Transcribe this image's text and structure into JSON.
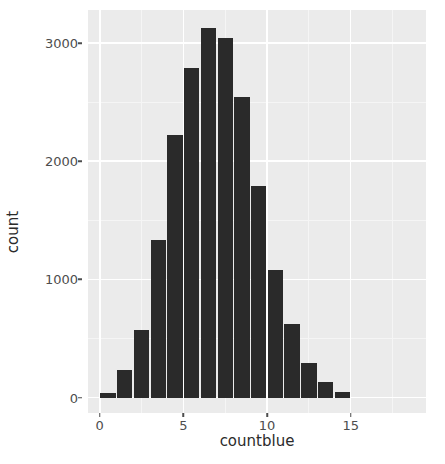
{
  "chart_data": {
    "type": "bar",
    "title": "",
    "subtitle": "",
    "xlabel": "countblue",
    "ylabel": "count",
    "xlim": [
      -0.7,
      19.5
    ],
    "ylim": [
      -130,
      3280
    ],
    "grid": true,
    "legend": null,
    "x_ticks": [
      0,
      5,
      10,
      15
    ],
    "x_tick_labels": [
      "0",
      "5",
      "10",
      "15"
    ],
    "y_ticks": [
      0,
      1000,
      2000,
      3000
    ],
    "y_tick_labels": [
      "0",
      "1000",
      "2000",
      "3000"
    ],
    "bar_width": 1,
    "bar_color": "#2a2a2a",
    "panel_color": "#ebebeb",
    "grid_color": "#ffffff",
    "categories": [
      0.5,
      1.5,
      2.5,
      3.5,
      4.5,
      5.5,
      6.5,
      7.5,
      8.5,
      9.5,
      10.5,
      11.5,
      12.5,
      13.5,
      14.5
    ],
    "values": [
      40,
      230,
      570,
      1330,
      2220,
      2790,
      3130,
      3040,
      2540,
      1790,
      1080,
      620,
      290,
      135,
      45
    ],
    "bin_edges": [
      0,
      1,
      2,
      3,
      4,
      5,
      6,
      7,
      8,
      9,
      10,
      11,
      12,
      13,
      14,
      15
    ]
  },
  "axes": {
    "x_title": "countblue",
    "y_title": "count"
  }
}
